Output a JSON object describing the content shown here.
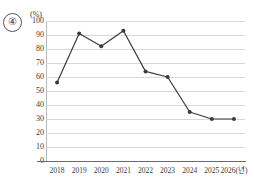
{
  "item_number": "④",
  "unit_label": "(%)",
  "axis": {
    "y_ticks": [
      100,
      90,
      80,
      70,
      60,
      50,
      40,
      30,
      20,
      10,
      0
    ],
    "x_labels": [
      "2018",
      "2019",
      "2020",
      "2021",
      "2022",
      "2023",
      "2024",
      "2025",
      "2026(년)"
    ],
    "grid": true,
    "line_color": "#3a3a3a",
    "grid_color": "#d8d8d8"
  },
  "chart_data": {
    "type": "line",
    "title": "",
    "subtitle": "",
    "xlabel": "년",
    "ylabel": "(%)",
    "categories": [
      "2018",
      "2019",
      "2020",
      "2021",
      "2022",
      "2023",
      "2024",
      "2025",
      "2026"
    ],
    "x_tick_labels": [
      "2018",
      "2019",
      "2020",
      "2021",
      "2022",
      "2023",
      "2024",
      "2025",
      "2026(년)"
    ],
    "values": [
      56,
      91,
      82,
      93,
      64,
      60,
      35,
      30,
      30
    ],
    "ylim": [
      0,
      100
    ],
    "ytick_step": 10,
    "grid": true,
    "legend": "none",
    "marker": "circle",
    "series_color": "#3a3a3a",
    "annotations": []
  }
}
